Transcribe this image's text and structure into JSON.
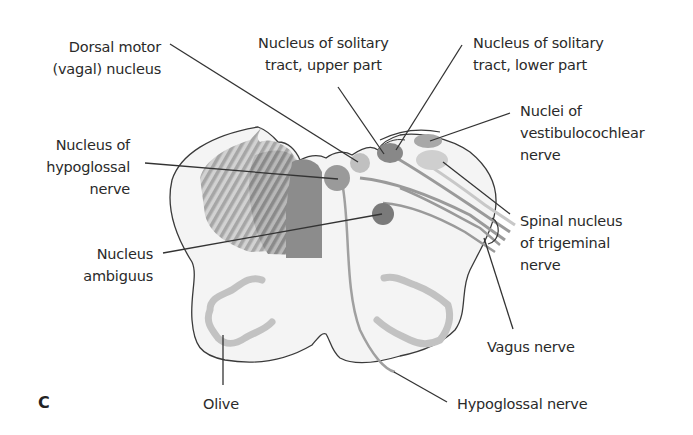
{
  "figure": {
    "panel_letter": "C",
    "colors": {
      "outline": "#3a3a3a",
      "tissue_fill": "#f3f3f3",
      "dark_nucleus": "#7a7a7a",
      "mid_nucleus": "#9a9a9a",
      "light_nucleus": "#c4c4c4",
      "hatch_light": "#b5b5b5",
      "hatch_dark": "#8e8e8e",
      "leader_line": "#333333"
    }
  },
  "labels": {
    "dorsal_motor": {
      "lines": [
        "Dorsal motor",
        "(vagal) nucleus"
      ]
    },
    "solitary_upper": {
      "lines": [
        "Nucleus of solitary",
        "tract, upper part"
      ]
    },
    "solitary_lower": {
      "lines": [
        "Nucleus of solitary",
        "tract, lower part"
      ]
    },
    "vestibulocochlear": {
      "lines": [
        "Nuclei of",
        "vestibulocochlear",
        "nerve"
      ]
    },
    "hypoglossal_nucleus": {
      "lines": [
        "Nucleus of",
        "hypoglossal",
        "nerve"
      ]
    },
    "spinal_trigeminal": {
      "lines": [
        "Spinal nucleus",
        "of trigeminal",
        "nerve"
      ]
    },
    "ambiguus": {
      "lines": [
        "Nucleus",
        "ambiguus"
      ]
    },
    "vagus": {
      "lines": [
        "Vagus nerve"
      ]
    },
    "olive": {
      "lines": [
        "Olive"
      ]
    },
    "hypoglossal_nerve": {
      "lines": [
        "Hypoglossal nerve"
      ]
    }
  }
}
